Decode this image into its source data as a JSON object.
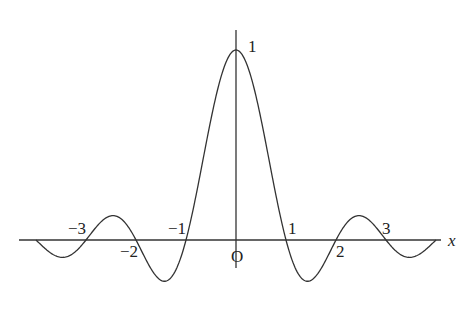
{
  "chart_data": {
    "type": "line",
    "title": "",
    "function": "y = sin(pi x) / (pi x)",
    "xlabel": "x",
    "ylabel": "",
    "origin_label": "O",
    "xlim": [
      -4,
      4
    ],
    "ylim": [
      -0.25,
      1.1
    ],
    "grid": false,
    "legend": "none",
    "x_tick_labels": [
      {
        "value": -3,
        "label": "−3",
        "position": "above"
      },
      {
        "value": -2,
        "label": "−2",
        "position": "below"
      },
      {
        "value": -1,
        "label": "−1",
        "position": "above"
      },
      {
        "value": 1,
        "label": "1",
        "position": "above"
      },
      {
        "value": 2,
        "label": "2",
        "position": "below"
      },
      {
        "value": 3,
        "label": "3",
        "position": "above"
      }
    ],
    "y_tick_labels": [
      {
        "value": 1,
        "label": "1"
      }
    ],
    "series": [
      {
        "name": "sinc",
        "x": [
          -4,
          -3.5,
          -3,
          -2.5,
          -2,
          -1.5,
          -1,
          -0.5,
          0,
          0.5,
          1,
          1.5,
          2,
          2.5,
          3,
          3.5,
          4
        ],
        "values": [
          0,
          -0.091,
          0,
          0.127,
          0,
          -0.212,
          0,
          0.637,
          1,
          0.637,
          0,
          -0.212,
          0,
          0.127,
          0,
          -0.091,
          0
        ]
      }
    ],
    "zeros": [
      -4,
      -3,
      -2,
      -1,
      1,
      2,
      3,
      4
    ],
    "max": {
      "x": 0,
      "y": 1
    }
  }
}
